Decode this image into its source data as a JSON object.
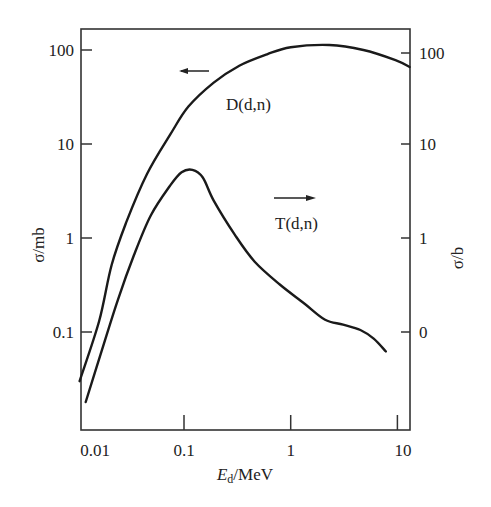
{
  "chart_data": {
    "type": "line",
    "title": "",
    "xlabel": "E_d/MeV",
    "xlabel_main": "E",
    "xlabel_sub": "d",
    "xlabel_rest": "/MeV",
    "ylabel": "σ/mb",
    "ylabel_right": "σ/b",
    "xscale": "log",
    "yscale": "log",
    "xlim": [
      0.0085,
      13
    ],
    "ylim": [
      0.012,
      170
    ],
    "grid": false,
    "x_ticks": [
      {
        "value": 0.01,
        "label": "0.01"
      },
      {
        "value": 0.1,
        "label": "0.1"
      },
      {
        "value": 1,
        "label": "1"
      },
      {
        "value": 10,
        "label": "10"
      }
    ],
    "y_ticks_left": [
      {
        "value": 0.1,
        "label": "0.1"
      },
      {
        "value": 1,
        "label": "1"
      },
      {
        "value": 10,
        "label": "10"
      },
      {
        "value": 100,
        "label": "100"
      }
    ],
    "y_ticks_right": [
      {
        "value": 0.1,
        "label": "0"
      },
      {
        "value": 1,
        "label": "1"
      },
      {
        "value": 10,
        "label": "10"
      },
      {
        "value": 100,
        "label": "100"
      }
    ],
    "series": [
      {
        "name": "D(d,n)",
        "axis": "left",
        "x": [
          0.0105,
          0.016,
          0.021,
          0.029,
          0.045,
          0.074,
          0.11,
          0.19,
          0.33,
          0.6,
          1.0,
          2.3,
          4.8,
          9.6,
          13
        ],
        "y": [
          0.03,
          0.13,
          0.52,
          1.5,
          4.8,
          12.5,
          25,
          45,
          68,
          90,
          107,
          113,
          100,
          78,
          66
        ]
      },
      {
        "name": "T(d,n)",
        "axis": "right",
        "x": [
          0.012,
          0.017,
          0.024,
          0.034,
          0.049,
          0.074,
          0.095,
          0.12,
          0.15,
          0.19,
          0.3,
          0.46,
          0.79,
          1.35,
          2.1,
          3.1,
          4.5,
          6.0,
          7.8
        ],
        "y": [
          0.018,
          0.064,
          0.22,
          0.66,
          1.75,
          3.6,
          5.0,
          5.3,
          4.4,
          2.5,
          1.08,
          0.56,
          0.32,
          0.2,
          0.135,
          0.12,
          0.105,
          0.085,
          0.062
        ]
      }
    ],
    "annotations": [
      {
        "text": "D(d,n)",
        "series": "D(d,n)",
        "at": [
          0.35,
          30
        ]
      },
      {
        "text": "T(d,n)",
        "series": "T(d,n)",
        "at": [
          0.42,
          2.1
        ]
      },
      {
        "type": "arrow",
        "direction": "left",
        "meaning": "D(d,n) uses left axis",
        "at": [
          0.045,
          74
        ]
      },
      {
        "type": "arrow",
        "direction": "right",
        "meaning": "T(d,n) uses right axis",
        "at": [
          0.4,
          3.9
        ]
      }
    ]
  }
}
